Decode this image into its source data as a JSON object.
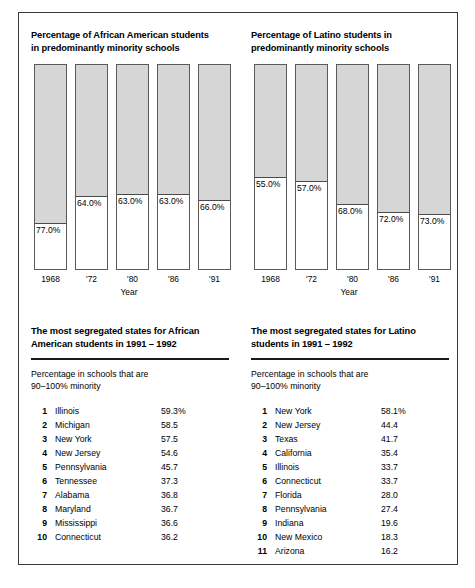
{
  "panels": [
    {
      "chart": {
        "title_line1": "Percentage of African American students",
        "title_line2": "in predominantly minority schools",
        "axis_label": "Year",
        "categories": [
          "1968",
          "'72",
          "'80",
          "'86",
          "'91"
        ],
        "values": [
          77.0,
          64.0,
          63.0,
          63.0,
          66.0
        ],
        "value_labels": [
          "77.0%",
          "64.0%",
          "63.0%",
          "63.0%",
          "66.0%"
        ]
      },
      "table": {
        "title_line1": "The most segregated states for African",
        "title_line2": "American students in 1991 – 1992",
        "subhead_line1": "Percentage in schools that are",
        "subhead_line2": "90–100% minority",
        "rows": [
          {
            "rank": "1",
            "state": "Illinois",
            "pct": "59.3%"
          },
          {
            "rank": "2",
            "state": "Michigan",
            "pct": "58.5"
          },
          {
            "rank": "3",
            "state": "New York",
            "pct": "57.5"
          },
          {
            "rank": "4",
            "state": "New Jersey",
            "pct": "54.6"
          },
          {
            "rank": "5",
            "state": "Pennsylvania",
            "pct": "45.7"
          },
          {
            "rank": "6",
            "state": "Tennessee",
            "pct": "37.3"
          },
          {
            "rank": "7",
            "state": "Alabama",
            "pct": "36.8"
          },
          {
            "rank": "8",
            "state": "Maryland",
            "pct": "36.7"
          },
          {
            "rank": "9",
            "state": "Mississippi",
            "pct": "36.6"
          },
          {
            "rank": "10",
            "state": "Connecticut",
            "pct": "36.2"
          }
        ]
      }
    },
    {
      "chart": {
        "title_line1": "Percentage of Latino students in",
        "title_line2": "predominantly minority schools",
        "axis_label": "Year",
        "categories": [
          "1968",
          "'72",
          "'80",
          "'86",
          "'91"
        ],
        "values": [
          55.0,
          57.0,
          68.0,
          72.0,
          73.0
        ],
        "value_labels": [
          "55.0%",
          "57.0%",
          "68.0%",
          "72.0%",
          "73.0%"
        ]
      },
      "table": {
        "title_line1": "The most segregated states for Latino",
        "title_line2": "students in 1991 – 1992",
        "subhead_line1": "Percentage in schools that are",
        "subhead_line2": "90–100% minority",
        "rows": [
          {
            "rank": "1",
            "state": "New York",
            "pct": "58.1%"
          },
          {
            "rank": "2",
            "state": "New Jersey",
            "pct": "44.4"
          },
          {
            "rank": "3",
            "state": "Texas",
            "pct": "41.7"
          },
          {
            "rank": "4",
            "state": "California",
            "pct": "35.4"
          },
          {
            "rank": "5",
            "state": "Illinois",
            "pct": "33.7"
          },
          {
            "rank": "6",
            "state": "Connecticut",
            "pct": "33.7"
          },
          {
            "rank": "7",
            "state": "Florida",
            "pct": "28.0"
          },
          {
            "rank": "8",
            "state": "Pennsylvania",
            "pct": "27.4"
          },
          {
            "rank": "9",
            "state": "Indiana",
            "pct": "19.6"
          },
          {
            "rank": "10",
            "state": "New Mexico",
            "pct": "18.3"
          },
          {
            "rank": "11",
            "state": "Arizona",
            "pct": "16.2"
          }
        ]
      }
    }
  ],
  "chart_data": [
    {
      "type": "bar",
      "title": "Percentage of African American students in predominantly minority schools",
      "xlabel": "Year",
      "ylabel": "",
      "categories": [
        "1968",
        "'72",
        "'80",
        "'86",
        "'91"
      ],
      "values": [
        77.0,
        64.0,
        63.0,
        63.0,
        66.0
      ],
      "data_labels": [
        "77.0%",
        "64.0%",
        "63.0%",
        "63.0%",
        "66.0%"
      ],
      "ylim": [
        0,
        100
      ],
      "grid": false,
      "legend": "none",
      "note": "Shaded (gray) portion at top of each column encodes the percentage value"
    },
    {
      "type": "bar",
      "title": "Percentage of Latino students in predominantly minority schools",
      "xlabel": "Year",
      "ylabel": "",
      "categories": [
        "1968",
        "'72",
        "'80",
        "'86",
        "'91"
      ],
      "values": [
        55.0,
        57.0,
        68.0,
        72.0,
        73.0
      ],
      "data_labels": [
        "55.0%",
        "57.0%",
        "68.0%",
        "72.0%",
        "73.0%"
      ],
      "ylim": [
        0,
        100
      ],
      "grid": false,
      "legend": "none",
      "note": "Shaded (gray) portion at top of each column encodes the percentage value"
    },
    {
      "type": "table",
      "title": "The most segregated states for African American students in 1991 – 1992",
      "subtitle": "Percentage in schools that are 90–100% minority",
      "columns": [
        "Rank",
        "State",
        "Percentage"
      ],
      "rows": [
        [
          "1",
          "Illinois",
          59.3
        ],
        [
          "2",
          "Michigan",
          58.5
        ],
        [
          "3",
          "New York",
          57.5
        ],
        [
          "4",
          "New Jersey",
          54.6
        ],
        [
          "5",
          "Pennsylvania",
          45.7
        ],
        [
          "6",
          "Tennessee",
          37.3
        ],
        [
          "7",
          "Alabama",
          36.8
        ],
        [
          "8",
          "Maryland",
          36.7
        ],
        [
          "9",
          "Mississippi",
          36.6
        ],
        [
          "10",
          "Connecticut",
          36.2
        ]
      ]
    },
    {
      "type": "table",
      "title": "The most segregated states for Latino students in 1991 – 1992",
      "subtitle": "Percentage in schools that are 90–100% minority",
      "columns": [
        "Rank",
        "State",
        "Percentage"
      ],
      "rows": [
        [
          "1",
          "New York",
          58.1
        ],
        [
          "2",
          "New Jersey",
          44.4
        ],
        [
          "3",
          "Texas",
          41.7
        ],
        [
          "4",
          "California",
          35.4
        ],
        [
          "5",
          "Illinois",
          33.7
        ],
        [
          "6",
          "Connecticut",
          33.7
        ],
        [
          "7",
          "Florida",
          28.0
        ],
        [
          "8",
          "Pennsylvania",
          27.4
        ],
        [
          "9",
          "Indiana",
          19.6
        ],
        [
          "10",
          "New Mexico",
          18.3
        ],
        [
          "11",
          "Arizona",
          16.2
        ]
      ]
    }
  ],
  "style": {
    "bar_fill": "#d6d6d6",
    "bar_stroke": "#5a5a5a",
    "frame_stroke": "#3a3a3a",
    "rule_color": "#1a1a1a"
  }
}
